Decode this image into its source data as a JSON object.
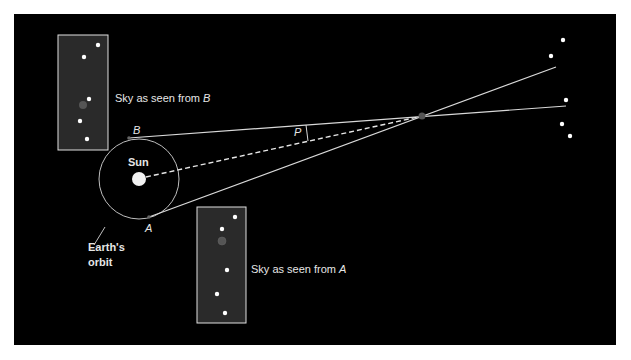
{
  "diagram": {
    "labels": {
      "sky_b_prefix": "Sky as seen from ",
      "sky_b_point": "B",
      "sky_a_prefix": "Sky as seen from ",
      "sky_a_point": "A",
      "sun": "Sun",
      "point_a": "A",
      "point_b": "B",
      "parallax_angle": "P",
      "orbit_line1": "Earth's",
      "orbit_line2": "orbit"
    },
    "colors": {
      "background": "#000000",
      "sky_box": "#2a2a2a",
      "line": "#d9d9d9",
      "star": "#ffffff",
      "nearby_star": "#555555",
      "frame": "#ffffff"
    },
    "sky_box_b": {
      "x": 58,
      "y": 35,
      "w": 50,
      "h": 115,
      "stars": [
        [
          98,
          45
        ],
        [
          84,
          57
        ],
        [
          89,
          99
        ],
        [
          80,
          121
        ],
        [
          87,
          139
        ]
      ],
      "nearby_star": [
        83,
        105
      ]
    },
    "sky_box_a": {
      "x": 197,
      "y": 207,
      "w": 49,
      "h": 116,
      "stars": [
        [
          235,
          217
        ],
        [
          222,
          229
        ],
        [
          227,
          270
        ],
        [
          217,
          294
        ],
        [
          225,
          313
        ]
      ],
      "nearby_star": [
        222,
        241
      ]
    },
    "orbit": {
      "cx": 139,
      "cy": 179,
      "r": 40
    },
    "sun": {
      "cx": 139,
      "cy": 179,
      "r": 7
    },
    "point_a": [
      149,
      217
    ],
    "point_b": [
      129,
      138
    ],
    "nearby_star": [
      422,
      116
    ],
    "distant_stars": [
      [
        563,
        40
      ],
      [
        551,
        56
      ],
      [
        566,
        100
      ],
      [
        562,
        124
      ],
      [
        570,
        136
      ]
    ]
  }
}
